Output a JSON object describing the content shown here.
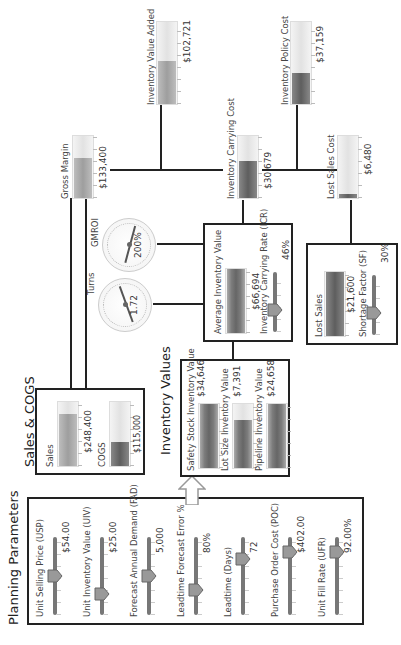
{
  "planning": {
    "title": "Planning Parameters",
    "params": [
      {
        "label": "Unit Selling Price (USP)",
        "value": "$54.00",
        "pos": 0.45
      },
      {
        "label": "Unit Inventory Value (UIV)",
        "value": "$25.00",
        "pos": 0.2
      },
      {
        "label": "Forecast Annual Demand (FAD)",
        "value": "5,000",
        "pos": 0.45
      },
      {
        "label": "Leadtime Forecast Error %",
        "value": "80%",
        "pos": 0.25
      },
      {
        "label": "Leadtime (Days)",
        "value": "72",
        "pos": 0.7
      },
      {
        "label": "Purchase Order Cost (POC)",
        "value": "$402.00",
        "pos": 0.8
      },
      {
        "label": "Unit Fill Rate (UFR)",
        "value": "92.00%",
        "pos": 0.8
      }
    ]
  },
  "sales_cogs": {
    "title": "Sales & COGS",
    "sales": {
      "label": "Sales",
      "value": "$248,400",
      "fill": 0.82
    },
    "cogs": {
      "label": "COGS",
      "value": "$115,000",
      "fill": 0.38
    }
  },
  "inventory_values": {
    "title": "Inventory Values",
    "items": [
      {
        "label": "Safety Stock Inventory Value",
        "value": "$34,646",
        "fill": 1.0
      },
      {
        "label": "Lot Size Inventory Value",
        "value": "$7,391",
        "fill": 0.75
      },
      {
        "label": "Pipeline Inventory Value",
        "value": "$24,658",
        "fill": 1.0
      }
    ]
  },
  "average_inventory": {
    "label": "Average Inventory Value",
    "value": "$66,694",
    "fill": 1.0,
    "rate_label": "Inventory Carrying Rate (ICR)",
    "rate_value": "46%",
    "rate_pos": 0.3
  },
  "lost_sales": {
    "label": "Lost Sales",
    "value": "$21,600",
    "fill": 1.0,
    "factor_label": "Shortage Factor (SF)",
    "factor_value": "30%",
    "factor_pos": 0.3
  },
  "gauges": {
    "turns": {
      "label": "Turns",
      "value": "1.72"
    },
    "gmroi": {
      "label": "GMROI",
      "value": "200%"
    }
  },
  "gross_margin": {
    "label": "Gross Margin",
    "value": "$133,400",
    "fill": 0.65
  },
  "inventory_value_added": {
    "label": "Inventory Value Added",
    "value": "$102,721",
    "fill": 0.52
  },
  "inventory_carrying_cost": {
    "label": "Inventory Carrying Cost",
    "value": "$30,679",
    "fill": 0.6
  },
  "inventory_policy_cost": {
    "label": "Inventory Policy Cost",
    "value": "$37,159",
    "fill": 0.38
  },
  "lost_sales_cost": {
    "label": "Lost Sales Cost",
    "value": "$6,480",
    "fill": 0.07
  }
}
